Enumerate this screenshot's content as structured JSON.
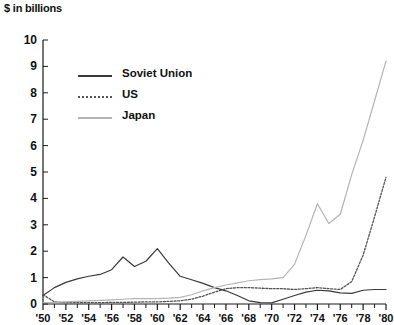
{
  "chart_data": {
    "type": "line",
    "title": "$ in billions",
    "xlabel": "",
    "ylabel": "$ in billions",
    "ylim": [
      0,
      10
    ],
    "xlim": [
      1950,
      1980
    ],
    "grid": false,
    "legend_position": "upper-left-inside",
    "y_ticks": [
      "0",
      "1",
      "2",
      "3",
      "4",
      "5",
      "6",
      "7",
      "8",
      "9",
      "10"
    ],
    "y_tick_values": [
      0,
      1,
      2,
      3,
      4,
      5,
      6,
      7,
      8,
      9,
      10
    ],
    "x_ticks": [
      "'50",
      "'52",
      "'54",
      "'56",
      "'58",
      "'60",
      "'62",
      "'64",
      "'66",
      "'68",
      "'70",
      "'72",
      "'74",
      "'76",
      "'78",
      "'80"
    ],
    "x_tick_values": [
      1950,
      1952,
      1954,
      1956,
      1958,
      1960,
      1962,
      1964,
      1966,
      1968,
      1970,
      1972,
      1974,
      1976,
      1978,
      1980
    ],
    "x_minor_ticks": [
      1950,
      1951,
      1952,
      1953,
      1954,
      1955,
      1956,
      1957,
      1958,
      1959,
      1960,
      1961,
      1962,
      1963,
      1964,
      1965,
      1966,
      1967,
      1968,
      1969,
      1970,
      1971,
      1972,
      1973,
      1974,
      1975,
      1976,
      1977,
      1978,
      1979,
      1980
    ],
    "x": [
      1950,
      1951,
      1952,
      1953,
      1954,
      1955,
      1956,
      1957,
      1958,
      1959,
      1960,
      1961,
      1962,
      1963,
      1964,
      1965,
      1966,
      1967,
      1968,
      1969,
      1970,
      1971,
      1972,
      1973,
      1974,
      1975,
      1976,
      1977,
      1978,
      1979,
      1980
    ],
    "series": [
      {
        "name": "Soviet Union",
        "color": "#3a3a3a",
        "style": "solid",
        "values": [
          0.32,
          0.62,
          0.82,
          0.95,
          1.05,
          1.12,
          1.3,
          1.78,
          1.42,
          1.62,
          2.1,
          1.55,
          1.05,
          0.92,
          0.78,
          0.62,
          0.5,
          0.32,
          0.12,
          0.05,
          0.04,
          0.18,
          0.32,
          0.45,
          0.52,
          0.5,
          0.42,
          0.4,
          0.52,
          0.55,
          0.55
        ]
      },
      {
        "name": "US",
        "color": "#555555",
        "style": "dotted",
        "values": [
          0.35,
          0.08,
          0.05,
          0.05,
          0.05,
          0.05,
          0.06,
          0.06,
          0.07,
          0.08,
          0.08,
          0.1,
          0.12,
          0.18,
          0.3,
          0.45,
          0.58,
          0.62,
          0.62,
          0.6,
          0.58,
          0.58,
          0.55,
          0.58,
          0.62,
          0.58,
          0.55,
          0.85,
          1.85,
          3.3,
          4.8
        ]
      },
      {
        "name": "Japan",
        "color": "#b4b4b4",
        "style": "solid",
        "values": [
          0.05,
          0.06,
          0.08,
          0.1,
          0.12,
          0.14,
          0.16,
          0.18,
          0.2,
          0.2,
          0.2,
          0.22,
          0.25,
          0.35,
          0.5,
          0.62,
          0.72,
          0.8,
          0.88,
          0.92,
          0.95,
          1.0,
          1.5,
          2.6,
          3.8,
          3.05,
          3.4,
          4.9,
          6.2,
          7.7,
          9.2
        ]
      }
    ]
  },
  "legend": {
    "items": [
      {
        "label": "Soviet Union",
        "color": "#3a3a3a",
        "style": "solid"
      },
      {
        "label": "US",
        "color": "#555555",
        "style": "dotted"
      },
      {
        "label": "Japan",
        "color": "#b4b4b4",
        "style": "solid"
      }
    ]
  }
}
